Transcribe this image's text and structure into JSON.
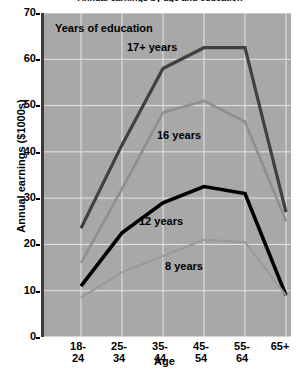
{
  "chart_data": {
    "type": "line",
    "title": "Annual earnings by age and education",
    "xlabel": "Age",
    "ylabel": "Annual earnings ($1000s)",
    "categories": [
      "18-\n24",
      "25-\n34",
      "35-\n44",
      "45-\n54",
      "55-\n64",
      "65+"
    ],
    "ylim": [
      0,
      70
    ],
    "yticks": [
      0,
      10,
      20,
      30,
      40,
      50,
      60,
      70
    ],
    "grid": true,
    "legend_position": "inline-annotations",
    "legend_title": "Years of education",
    "plot_background": "#a8a8a8",
    "series": [
      {
        "name": "17+ years",
        "color": "#404040",
        "width": 3.2,
        "values": [
          23.5,
          41.5,
          58.0,
          62.5,
          62.5,
          27.0
        ]
      },
      {
        "name": "16 years",
        "color": "#8f8f8f",
        "width": 2.6,
        "values": [
          16.0,
          32.0,
          48.5,
          51.0,
          46.5,
          25.0
        ]
      },
      {
        "name": "12 years",
        "color": "#000000",
        "width": 3.6,
        "values": [
          11.0,
          22.5,
          29.0,
          32.5,
          31.0,
          9.0
        ]
      },
      {
        "name": "8 years",
        "color": "#9a9a9a",
        "width": 2.2,
        "values": [
          8.5,
          14.0,
          17.5,
          21.0,
          20.5,
          9.0
        ]
      }
    ],
    "annotations": [
      {
        "text": "Years of education",
        "x_px": 55,
        "y_px": 22
      },
      {
        "text": "17+ years",
        "x_px": 127,
        "y_px": 41
      },
      {
        "text": "16 years",
        "x_px": 157,
        "y_px": 129
      },
      {
        "text": "12 years",
        "x_px": 139,
        "y_px": 215
      },
      {
        "text": "8 years",
        "x_px": 165,
        "y_px": 260
      }
    ]
  }
}
